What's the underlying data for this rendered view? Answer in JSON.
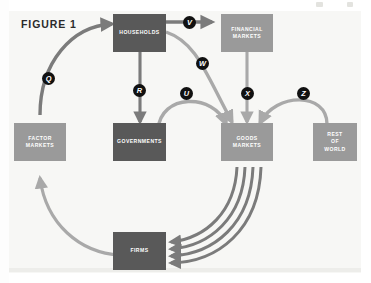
{
  "figure": {
    "title": "FIGURE 1",
    "panel_bg": "#f7f7f5",
    "dark_node_color": "#595959",
    "light_node_color": "#9a9a9a",
    "dark_arrow_color": "#7b7b7b",
    "light_arrow_color": "#a9a9a9",
    "badge_color": "#111111"
  },
  "nodes": [
    {
      "id": "households",
      "label": "HOUSEHOLDS",
      "tone": "dark"
    },
    {
      "id": "financial-markets",
      "label": "FINANCIAL\nMARKETS",
      "tone": "light"
    },
    {
      "id": "factor-markets",
      "label": "FACTOR\nMARKETS",
      "tone": "light"
    },
    {
      "id": "governments",
      "label": "GOVERNMENTS",
      "tone": "dark"
    },
    {
      "id": "goods-markets",
      "label": "GOODS\nMARKETS",
      "tone": "light"
    },
    {
      "id": "rest-of-world",
      "label": "REST\nOF\nWORLD",
      "tone": "light"
    },
    {
      "id": "firms",
      "label": "FIRMS",
      "tone": "dark"
    }
  ],
  "flow_labels": [
    {
      "id": "q",
      "letter": "Q",
      "from": "firms",
      "to": "households"
    },
    {
      "id": "r",
      "letter": "R",
      "from": "households",
      "to": "governments"
    },
    {
      "id": "u",
      "letter": "U",
      "from": "governments",
      "to": "goods-markets"
    },
    {
      "id": "v",
      "letter": "V",
      "from": "households",
      "to": "financial-markets"
    },
    {
      "id": "w",
      "letter": "W",
      "from": "households",
      "to": "goods-markets"
    },
    {
      "id": "x",
      "letter": "X",
      "from": "financial-markets",
      "to": "goods-markets"
    },
    {
      "id": "z",
      "letter": "Z",
      "from": "rest-of-world",
      "to": "goods-markets"
    }
  ]
}
